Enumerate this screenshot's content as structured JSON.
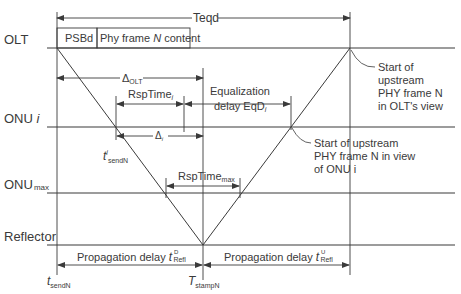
{
  "diagram": {
    "rows": {
      "olt": "OLT",
      "onu_i_main": "ONU ",
      "onu_i_italic": "i",
      "onu_max_main": "ONU",
      "onu_max_sub": "max",
      "reflector": "Reflector"
    },
    "top": {
      "teqd": "Teqd",
      "psbd": "PSBd",
      "frame_content_pre": "Phy frame ",
      "frame_content_n": "N",
      "frame_content_post": " content"
    },
    "intervals": {
      "delta_olt_main": "Δ",
      "delta_olt_sub": "OLT",
      "rsptime_i_main": "RspTime",
      "rsptime_i_sub": "i",
      "eq_line1": "Equalization",
      "eq_line2_main": "delay EqD",
      "eq_line2_sub": "i",
      "delta_i_main": "Δ",
      "delta_i_sub": "i",
      "rsptime_max_main": "RspTime",
      "rsptime_max_sub": "max"
    },
    "annotations": {
      "olt_view": [
        "Start of",
        "upstream",
        "PHY frame N",
        "in OLT's view"
      ],
      "onu_view": [
        "Start of upstream",
        "PHY frame N in view",
        "of ONU i"
      ]
    },
    "times": {
      "t_send_prime_main": "t",
      "t_send_prime_sup": "i",
      "t_send_prime_sub": "sendN",
      "t_send_main": "t",
      "t_send_sub": "sendN",
      "t_stamp_main": "T",
      "t_stamp_sub": "stampN"
    },
    "bottom": {
      "prop_down_text": "Propagation delay ",
      "prop_down_t": "t",
      "prop_down_sup": "D",
      "prop_down_sub": "Refl",
      "prop_up_text": "Propagation delay ",
      "prop_up_t": "t",
      "prop_up_sup": "U",
      "prop_up_sub": "Refl"
    },
    "colors": {
      "line": "#3a3a3a",
      "text": "#3a3a3a",
      "background": "#ffffff"
    }
  }
}
